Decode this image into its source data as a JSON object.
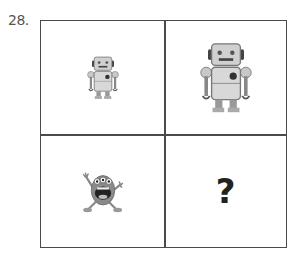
{
  "question": {
    "number": "28."
  },
  "grid": {
    "cells": [
      {
        "position": "top-left",
        "content": "small-robot",
        "description": "small robot"
      },
      {
        "position": "top-right",
        "content": "large-robot",
        "description": "large robot"
      },
      {
        "position": "bottom-left",
        "content": "small-monster",
        "description": "small three-eyed monster"
      },
      {
        "position": "bottom-right",
        "content": "question-mark",
        "text": "?"
      }
    ]
  },
  "colors": {
    "border": "#4a4a4a",
    "robot_body": "#c8c8c8",
    "robot_dark": "#444444",
    "monster_body": "#8a8a8a",
    "text": "#555555"
  }
}
